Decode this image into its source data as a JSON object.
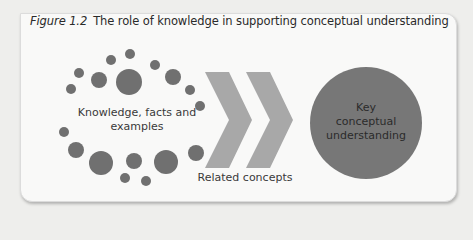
{
  "figure": {
    "number": "Figure 1.2",
    "title": "The role of knowledge in supporting conceptual understanding"
  },
  "nodes": {
    "knowledge": "Knowledge, facts and examples",
    "knowledge_line1": "Knowledge, facts and",
    "knowledge_line2": "examples",
    "related": "Related concepts",
    "key_line1": "Key",
    "key_line2": "conceptual",
    "key_line3": "understanding"
  },
  "colors": {
    "dot": "#707070",
    "chevron": "#a8a8a8",
    "circle": "#777777",
    "panel": "#f9f9f8"
  }
}
